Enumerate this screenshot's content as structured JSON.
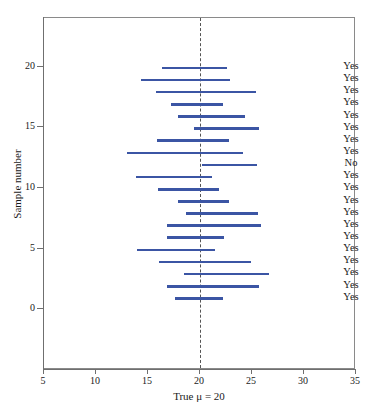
{
  "chart_data": {
    "type": "line",
    "title": "",
    "subtitle": "",
    "xlabel": "True μ = 20",
    "ylabel": "Sample number",
    "xlim": [
      5,
      35
    ],
    "ylim": [
      -5,
      24
    ],
    "xticks": [
      5,
      10,
      15,
      20,
      25,
      30,
      35
    ],
    "xtick_labels": [
      "5",
      "10",
      "15",
      "20",
      "25",
      "30",
      "35"
    ],
    "yticks": [
      0,
      5,
      10,
      15,
      20
    ],
    "ytick_labels": [
      "0",
      "5",
      "10",
      "15",
      "20"
    ],
    "grid": false,
    "legend": "none",
    "reference_line": {
      "name": "true-mean",
      "value": 20,
      "orientation": "vertical",
      "style": "dashed",
      "label": "True μ = 20"
    },
    "series_color": "#3b55a4",
    "annotation_column_header": "",
    "intervals": [
      {
        "sample": 20,
        "lower": 16.3,
        "upper": 22.6,
        "captures": "Yes"
      },
      {
        "sample": 19,
        "lower": 14.3,
        "upper": 22.9,
        "captures": "Yes"
      },
      {
        "sample": 18,
        "lower": 15.8,
        "upper": 25.4,
        "captures": "Yes"
      },
      {
        "sample": 17,
        "lower": 17.2,
        "upper": 22.2,
        "captures": "Yes"
      },
      {
        "sample": 16,
        "lower": 17.9,
        "upper": 24.3,
        "captures": "Yes"
      },
      {
        "sample": 15,
        "lower": 19.4,
        "upper": 25.7,
        "captures": "Yes"
      },
      {
        "sample": 14,
        "lower": 15.9,
        "upper": 22.8,
        "captures": "Yes"
      },
      {
        "sample": 13,
        "lower": 13.0,
        "upper": 24.1,
        "captures": "Yes"
      },
      {
        "sample": 12,
        "lower": 20.2,
        "upper": 25.5,
        "captures": "No"
      },
      {
        "sample": 11,
        "lower": 13.8,
        "upper": 21.2,
        "captures": "Yes"
      },
      {
        "sample": 10,
        "lower": 16.0,
        "upper": 21.8,
        "captures": "Yes"
      },
      {
        "sample": 9,
        "lower": 17.9,
        "upper": 22.8,
        "captures": "Yes"
      },
      {
        "sample": 8,
        "lower": 18.7,
        "upper": 25.6,
        "captures": "Yes"
      },
      {
        "sample": 7,
        "lower": 16.8,
        "upper": 25.9,
        "captures": "Yes"
      },
      {
        "sample": 6,
        "lower": 16.8,
        "upper": 22.3,
        "captures": "Yes"
      },
      {
        "sample": 5,
        "lower": 13.9,
        "upper": 21.4,
        "captures": "Yes"
      },
      {
        "sample": 4,
        "lower": 16.1,
        "upper": 24.9,
        "captures": "Yes"
      },
      {
        "sample": 3,
        "lower": 18.5,
        "upper": 26.6,
        "captures": "Yes"
      },
      {
        "sample": 2,
        "lower": 16.8,
        "upper": 25.7,
        "captures": "Yes"
      },
      {
        "sample": 1,
        "lower": 17.6,
        "upper": 22.2,
        "captures": "Yes"
      }
    ]
  }
}
